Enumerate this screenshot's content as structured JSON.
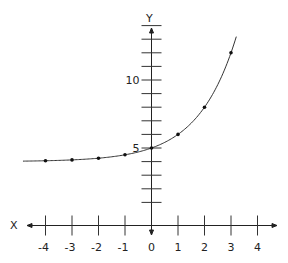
{
  "chart_data": {
    "type": "line",
    "title": "",
    "xlabel": "X",
    "ylabel": "Y",
    "function": "y = 2^x + 4",
    "x": [
      -4,
      -3,
      -2,
      -1,
      0,
      1,
      2,
      3
    ],
    "series": [
      {
        "name": "y = 2^x + 4",
        "values": [
          4.0625,
          4.125,
          4.25,
          4.5,
          5,
          6,
          8,
          12
        ]
      }
    ],
    "x_ticks": [
      -4,
      -3,
      -2,
      -1,
      0,
      1,
      2,
      3,
      4
    ],
    "x_tick_labels": [
      "-4",
      "-3",
      "-2",
      "-1",
      "0",
      "1",
      "2",
      "3",
      "4"
    ],
    "y_ticks": [
      1,
      2,
      3,
      4,
      5,
      6,
      7,
      8,
      9,
      10,
      11,
      12,
      13,
      14
    ],
    "y_tick_labels": {
      "5": "5",
      "10": "10"
    },
    "xlim": [
      -5,
      5
    ],
    "ylim": [
      0,
      15
    ],
    "grid": false,
    "legend": "none"
  },
  "axes": {
    "x_label": "X",
    "y_label": "Y"
  }
}
